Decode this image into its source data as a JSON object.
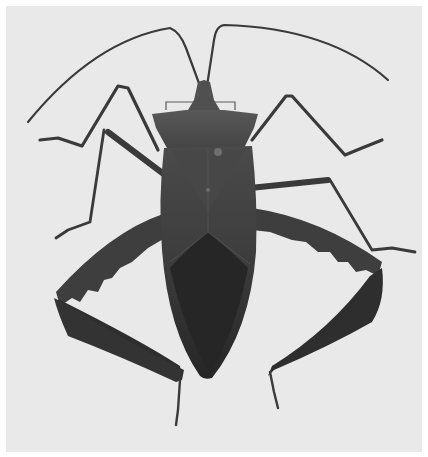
{
  "image": {
    "subject": "Leaf-footed bug (Coreidae), dorsal view",
    "style": "grayscale photograph",
    "background": "light gray",
    "colors": {
      "frame": "#ffffff",
      "background": "#e9e9e9",
      "body_dark": "#2c2c2c",
      "body_mid": "#454545",
      "pronotum": "#4e4e4e",
      "leg": "#3a3a3a",
      "highlight": "#6a6a6a"
    },
    "parts": [
      "antennae",
      "head",
      "pronotum",
      "wings",
      "front legs",
      "middle legs",
      "hind legs with leaf-like tibiae"
    ]
  }
}
